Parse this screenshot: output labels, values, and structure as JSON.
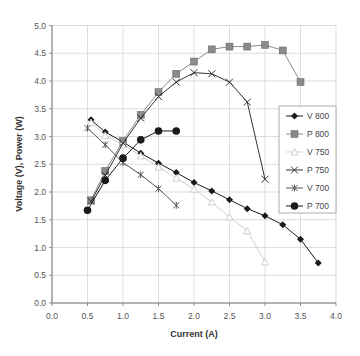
{
  "chart_data": {
    "type": "line",
    "title": "",
    "xlabel": "Current (A)",
    "ylabel": "Voltage (V), Power (W)",
    "xlim": [
      0.0,
      4.0
    ],
    "ylim": [
      0.0,
      5.0
    ],
    "xticks": [
      "0.0",
      "0.5",
      "1.0",
      "1.5",
      "2.0",
      "2.5",
      "3.0",
      "3.5",
      "4.0"
    ],
    "yticks": [
      "0.0",
      "0.5",
      "1.0",
      "1.5",
      "2.0",
      "2.5",
      "3.0",
      "3.5",
      "4.0",
      "4.5",
      "5.0"
    ],
    "grid": true,
    "legend_position": "right-inside",
    "series": [
      {
        "name": "V 800",
        "marker": "diamond",
        "color": "#1a1a1a",
        "x": [
          0.55,
          0.75,
          1.0,
          1.25,
          1.5,
          1.75,
          2.0,
          2.25,
          2.5,
          2.75,
          3.0,
          3.25,
          3.5,
          3.75
        ],
        "y": [
          3.3,
          3.08,
          2.9,
          2.7,
          2.52,
          2.35,
          2.17,
          2.02,
          1.86,
          1.7,
          1.57,
          1.41,
          1.15,
          0.72
        ]
      },
      {
        "name": "P 800",
        "marker": "square",
        "color": "#8a8a8a",
        "x": [
          0.55,
          0.75,
          1.0,
          1.25,
          1.5,
          1.75,
          2.0,
          2.25,
          2.5,
          2.75,
          3.0,
          3.25,
          3.5
        ],
        "y": [
          1.85,
          2.38,
          2.92,
          3.39,
          3.8,
          4.13,
          4.35,
          4.57,
          4.62,
          4.62,
          4.65,
          4.55,
          3.98
        ]
      },
      {
        "name": "V 750",
        "marker": "triangle",
        "color": "#cfcfcf",
        "x": [
          0.55,
          0.75,
          1.0,
          1.25,
          1.5,
          1.75,
          2.0,
          2.25,
          2.5,
          2.75,
          3.0
        ],
        "y": [
          3.25,
          3.02,
          2.85,
          2.65,
          2.45,
          2.25,
          2.05,
          1.82,
          1.55,
          1.3,
          0.74
        ]
      },
      {
        "name": "P 750",
        "marker": "x",
        "color": "#333333",
        "x": [
          0.55,
          0.75,
          1.0,
          1.25,
          1.5,
          1.75,
          2.0,
          2.25,
          2.5,
          2.75,
          3.0
        ],
        "y": [
          1.83,
          2.3,
          2.88,
          3.33,
          3.72,
          3.98,
          4.15,
          4.13,
          3.98,
          3.62,
          2.23
        ]
      },
      {
        "name": "V 700",
        "marker": "star",
        "color": "#555555",
        "x": [
          0.5,
          0.75,
          1.0,
          1.25,
          1.5,
          1.75
        ],
        "y": [
          3.15,
          2.85,
          2.53,
          2.31,
          2.06,
          1.76
        ]
      },
      {
        "name": "P 700",
        "marker": "circle",
        "color": "#1a1a1a",
        "x": [
          0.5,
          0.75,
          1.0,
          1.25,
          1.5,
          1.75
        ],
        "y": [
          1.67,
          2.21,
          2.61,
          2.94,
          3.1,
          3.1
        ]
      }
    ]
  }
}
